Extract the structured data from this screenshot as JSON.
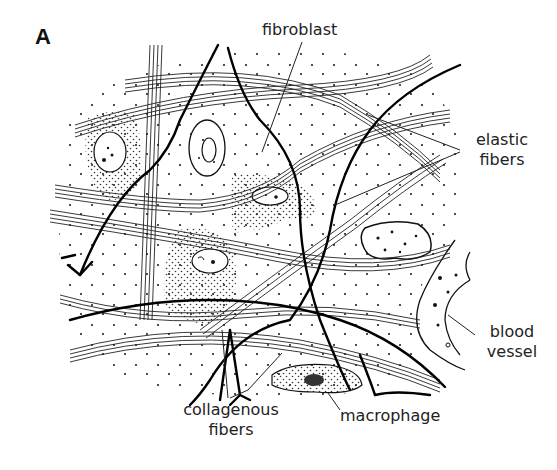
{
  "figure": {
    "panel_letter": "A",
    "labels": {
      "fibroblast": "fibroblast",
      "elastic_fibers_line1": "elastic",
      "elastic_fibers_line2": "fibers",
      "blood_vessel_line1": "blood",
      "blood_vessel_line2": "vessel",
      "collagenous_fibers_line1": "collagenous",
      "collagenous_fibers_line2": "fibers",
      "macrophage": "macrophage"
    },
    "colors": {
      "ink": "#111111",
      "background": "#ffffff"
    }
  }
}
